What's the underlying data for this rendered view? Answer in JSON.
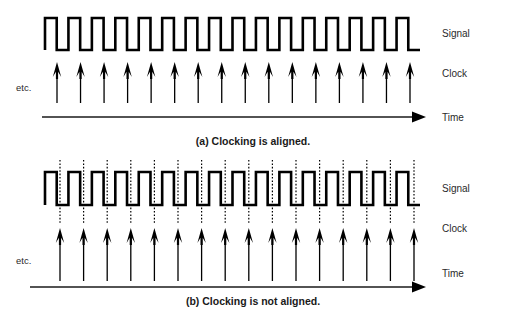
{
  "figure": {
    "background_color": "#ffffff",
    "stroke_color": "#000000",
    "text_color": "#1a1a1a"
  },
  "panels": [
    {
      "id": "panel-a",
      "caption": "(a) Clocking is aligned.",
      "etc_label": "etc.",
      "labels": {
        "signal": "Signal",
        "clock": "Clock",
        "time": "Time"
      },
      "aligned": true,
      "pulse_count": 16,
      "arrow_count": 16,
      "dotted_guides": false
    },
    {
      "id": "panel-b",
      "caption": "(b) Clocking is not aligned.",
      "etc_label": "etc.",
      "labels": {
        "signal": "Signal",
        "clock": "Clock",
        "time": "Time"
      },
      "aligned": false,
      "pulse_count": 16,
      "arrow_count": 16,
      "dotted_guides": true
    }
  ],
  "chart_data": {
    "type": "line",
    "xlabel": "Time",
    "ylabel": "",
    "grid": false,
    "legend": "none",
    "series": [
      {
        "name": "Signal (a) aligned",
        "kind": "square-wave",
        "pulses": 16,
        "x_start": 45,
        "x_end": 420,
        "y_high": 18,
        "y_low": 50,
        "duty_cycle": 0.5,
        "phase_offset": 0.0
      },
      {
        "name": "Clock (a) aligned",
        "kind": "arrow-ticks",
        "count": 16,
        "x_start": 57,
        "x_end": 410,
        "y_base": 103,
        "y_tip": 62,
        "tick_phase_offsets": [
          0,
          0,
          0,
          0,
          0,
          0,
          0,
          0,
          0,
          0,
          0,
          0,
          0,
          0,
          0,
          0
        ]
      },
      {
        "name": "Signal (b) not aligned",
        "kind": "square-wave",
        "pulses": 16,
        "x_start": 45,
        "x_end": 420,
        "y_high": 172,
        "y_low": 205,
        "duty_cycle": 0.5,
        "phase_offset": 0.0
      },
      {
        "name": "Clock (b) not aligned",
        "kind": "arrow-ticks",
        "count": 16,
        "x_start": 60,
        "x_end": 414,
        "y_base": 281,
        "y_tip": 228,
        "tick_phase_offsets": [
          0.12,
          0.2,
          0.28,
          0.36,
          0.44,
          0.52,
          0.6,
          0.68,
          0.76,
          0.84,
          0.92,
          1.0,
          1.08,
          1.16,
          1.24,
          1.32
        ]
      }
    ],
    "annotations": [
      {
        "text": "Signal",
        "panel": "a"
      },
      {
        "text": "Clock",
        "panel": "a"
      },
      {
        "text": "Time",
        "panel": "a"
      },
      {
        "text": "etc.",
        "panel": "a"
      },
      {
        "text": "(a) Clocking is aligned.",
        "panel": "a"
      },
      {
        "text": "Signal",
        "panel": "b"
      },
      {
        "text": "Clock",
        "panel": "b"
      },
      {
        "text": "Time",
        "panel": "b"
      },
      {
        "text": "etc.",
        "panel": "b"
      },
      {
        "text": "(b) Clocking is not aligned.",
        "panel": "b"
      }
    ]
  }
}
